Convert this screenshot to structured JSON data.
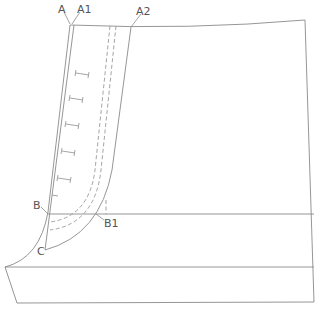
{
  "diagram": {
    "type": "garment pattern draft (front panel with placket / fly)",
    "colors": {
      "line": "#8a8a8a",
      "dashed": "#9a9a9a",
      "label": "#555555",
      "background": "#ffffff"
    },
    "labels": {
      "A": "A",
      "A1": "A1",
      "A2": "A2",
      "B": "B",
      "B1": "B1",
      "C": "C"
    },
    "points": [
      {
        "id": "A",
        "x": 70,
        "y": 25
      },
      {
        "id": "A1",
        "x": 74,
        "y": 25
      },
      {
        "id": "A2",
        "x": 131,
        "y": 27
      },
      {
        "id": "B",
        "x": 48,
        "y": 214
      },
      {
        "id": "B1",
        "x": 96,
        "y": 214
      },
      {
        "id": "C",
        "x": 45,
        "y": 250
      }
    ],
    "buttonhole_count": 5
  }
}
